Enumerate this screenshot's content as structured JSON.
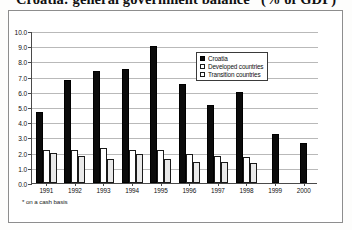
{
  "title": "Croatia: general government balance* (% of GDP)",
  "footnote": "* on a cash basis",
  "legend": {
    "items": [
      {
        "label": "Croatia",
        "style": "croatia"
      },
      {
        "label": "Developed countries",
        "style": "developed"
      },
      {
        "label": "Transition countries",
        "style": "transition"
      }
    ]
  },
  "chart_data": {
    "type": "bar",
    "title": "Croatia: general government balance* (% of GDP)",
    "xlabel": "",
    "ylabel": "",
    "ylim": [
      0.0,
      10.0
    ],
    "ytick_step": 1.0,
    "ytick_labels": [
      "0.0",
      "1.0",
      "2.0",
      "3.0",
      "4.0",
      "5.0",
      "6.0",
      "7.0",
      "8.0",
      "9.0",
      "10.0"
    ],
    "grid": true,
    "legend_position": "inside-top-right",
    "categories": [
      "1991",
      "1992",
      "1993",
      "1994",
      "1995",
      "1996",
      "1997",
      "1998",
      "1999",
      "2000"
    ],
    "series": [
      {
        "name": "Croatia",
        "values": [
          4.7,
          6.8,
          7.4,
          7.5,
          9.0,
          6.5,
          5.1,
          6.0,
          3.2,
          2.6
        ]
      },
      {
        "name": "Developed countries",
        "values": [
          2.2,
          2.2,
          2.3,
          2.2,
          2.2,
          1.9,
          1.8,
          1.7,
          null,
          null
        ]
      },
      {
        "name": "Transition countries",
        "values": [
          2.0,
          1.8,
          1.6,
          1.9,
          1.6,
          1.4,
          1.4,
          1.3,
          null,
          null
        ]
      }
    ]
  }
}
